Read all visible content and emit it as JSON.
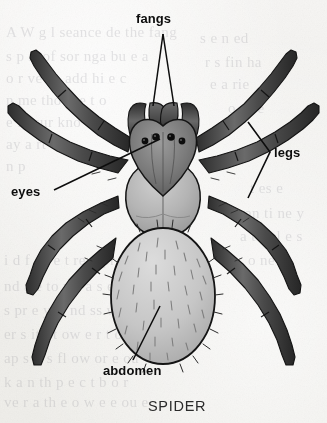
{
  "figure": {
    "caption": "SPIDER",
    "medium": "scanned textbook illustration, grayscale line art"
  },
  "labels": [
    {
      "id": "fangs",
      "text": "fangs",
      "x": 136,
      "y": 18,
      "leader": "double-v-down"
    },
    {
      "id": "legs",
      "text": "legs",
      "x": 272,
      "y": 152,
      "leader": "left-bracket-chevron"
    },
    {
      "id": "eyes",
      "text": "eyes",
      "x": 12,
      "y": 185,
      "leader": "diagonal-up-right"
    },
    {
      "id": "abdomen",
      "text": "abdomen",
      "x": 104,
      "y": 368,
      "leader": "diagonal-up-right"
    }
  ],
  "ghost_text": [
    {
      "text": "A   W  g  l  seance de the  fang",
      "x": 6,
      "y": 24
    },
    {
      "text": "s  p rt of sor nga  bu e a",
      "x": 6,
      "y": 48
    },
    {
      "text": "o  r ve  ce  add  hi e c",
      "x": 6,
      "y": 70
    },
    {
      "text": "n  me  tho  il e  t o",
      "x": 6,
      "y": 92
    },
    {
      "text": "e  fa  sur  kno",
      "x": 6,
      "y": 114
    },
    {
      "text": "ay  a  rt",
      "x": 6,
      "y": 136
    },
    {
      "text": "n  p",
      "x": 6,
      "y": 158
    },
    {
      "text": "s  e  n  ed",
      "x": 200,
      "y": 30
    },
    {
      "text": "r  s  fin  ha",
      "x": 205,
      "y": 54
    },
    {
      "text": "e  a  rie",
      "x": 210,
      "y": 76
    },
    {
      "text": "o u  re",
      "x": 228,
      "y": 100
    },
    {
      "text": "t  es e",
      "x": 250,
      "y": 180
    },
    {
      "text": "an  ti  ne  y",
      "x": 245,
      "y": 205
    },
    {
      "text": "a  t r  el  e  s",
      "x": 240,
      "y": 228
    },
    {
      "text": "o  ne  is",
      "x": 248,
      "y": 252
    },
    {
      "text": "i d  f  a  ve  t   re u  pr e",
      "x": 4,
      "y": 252
    },
    {
      "text": "nd  a  e  to  y  s  a  s  eve",
      "x": 4,
      "y": 278
    },
    {
      "text": "s  pr e  y  st  nd  ss  w  cr pt",
      "x": 4,
      "y": 302
    },
    {
      "text": "er  s  it  t  t  ow  e  r  t  on",
      "x": 4,
      "y": 326
    },
    {
      "text": "ap s  it  s  fl  ow  or  e  ou",
      "x": 4,
      "y": 350
    },
    {
      "text": "k  a n  th  p  e  c  t  b  o  r",
      "x": 4,
      "y": 374
    },
    {
      "text": "ve  r  a  th e  o w  e  e  ou e",
      "x": 4,
      "y": 394
    }
  ],
  "colors": {
    "paper": "#f3f2f0",
    "ink": "#0d0d0d",
    "leg_dark": "#3a3a3a",
    "leg_mid": "#585858",
    "carapace_dark": "#6e6e6e",
    "carapace_mid": "#8c8c8c",
    "cephalothorax_light": "#b9b9b9",
    "abdomen_light": "#c9c9c9",
    "outline": "#141414",
    "caption": "#2a2a2a"
  },
  "anatomy": {
    "eyes_count": 4,
    "legs_count": 8,
    "parts": [
      "fangs",
      "eyes",
      "cephalothorax",
      "abdomen",
      "legs"
    ]
  }
}
